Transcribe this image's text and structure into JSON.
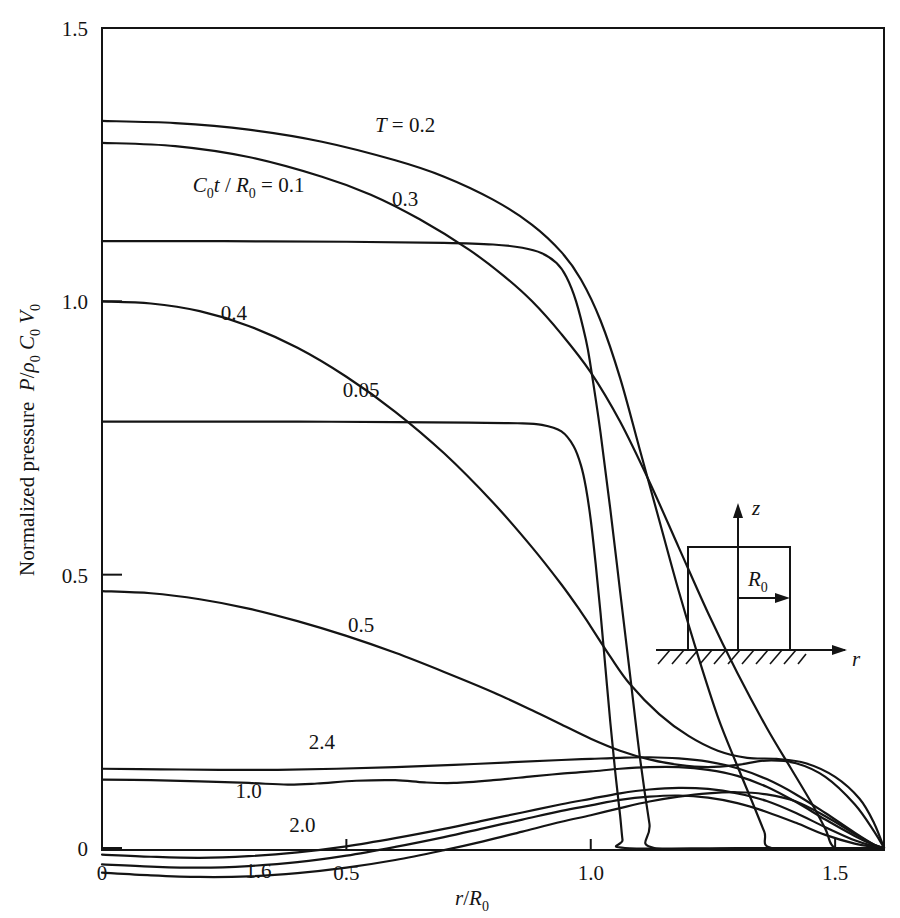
{
  "figure": {
    "kind": "line-plot",
    "background": "#ffffff",
    "ink_color": "#141414"
  },
  "chart_data": {
    "type": "line",
    "title": "",
    "subtitle": "",
    "xlabel": "r/R0",
    "xlabel_parts": {
      "var": "r",
      "slash": "/",
      "denom": "R",
      "denom_sub": "0"
    },
    "ylabel": "Normalized pressure P/ρ0 C0 V0",
    "ylabel_parts": {
      "text": "Normalized pressure",
      "p": "P",
      "slash": "/",
      "rho": "ρ",
      "rho_sub": "0",
      "c": "C",
      "c_sub": "0",
      "v": "V",
      "v_sub": "0"
    },
    "xlim": [
      0,
      1.6
    ],
    "ylim": [
      -0.09,
      1.5
    ],
    "grid": false,
    "legend_position": "inline-curve-labels",
    "xticks": [
      0,
      0.5,
      1.0,
      1.5
    ],
    "xtick_labels": [
      "0",
      "0.5",
      "1.0",
      "1.5"
    ],
    "yticks": [
      0,
      0.5,
      1.0,
      1.5
    ],
    "ytick_labels": [
      "0",
      "0.5",
      "1.0",
      "1.5"
    ],
    "parameter_name": "C0t/R0",
    "parameter_legend_text": "C0t / R0 = 0.1",
    "first_label_text": "T = 0.2",
    "series": [
      {
        "name": "0.05",
        "label": "0.05",
        "label_x": 0.53,
        "label_y": 0.825,
        "start_value": 0.78,
        "end_x": 1.07,
        "points": [
          [
            0.0,
            0.78
          ],
          [
            0.2,
            0.78
          ],
          [
            0.4,
            0.78
          ],
          [
            0.6,
            0.779
          ],
          [
            0.75,
            0.778
          ],
          [
            0.85,
            0.777
          ],
          [
            0.9,
            0.774
          ],
          [
            0.94,
            0.762
          ],
          [
            0.965,
            0.735
          ],
          [
            0.98,
            0.7
          ],
          [
            0.99,
            0.66
          ],
          [
            1.0,
            0.6
          ],
          [
            1.01,
            0.52
          ],
          [
            1.02,
            0.43
          ],
          [
            1.03,
            0.33
          ],
          [
            1.04,
            0.23
          ],
          [
            1.05,
            0.14
          ],
          [
            1.06,
            0.06
          ],
          [
            1.065,
            0.015
          ],
          [
            1.07,
            0.0
          ],
          [
            1.3,
            0.0
          ],
          [
            1.6,
            0.0
          ]
        ]
      },
      {
        "name": "0.1",
        "label": "C0t / R0 = 0.1",
        "label_x": 0.3,
        "label_y": 1.2,
        "start_value": 1.11,
        "end_x": 1.13,
        "points": [
          [
            0.0,
            1.11
          ],
          [
            0.25,
            1.11
          ],
          [
            0.5,
            1.109
          ],
          [
            0.7,
            1.107
          ],
          [
            0.8,
            1.104
          ],
          [
            0.86,
            1.098
          ],
          [
            0.9,
            1.088
          ],
          [
            0.93,
            1.07
          ],
          [
            0.95,
            1.045
          ],
          [
            0.97,
            1.0
          ],
          [
            0.99,
            0.93
          ],
          [
            1.0,
            0.88
          ],
          [
            1.02,
            0.76
          ],
          [
            1.04,
            0.62
          ],
          [
            1.06,
            0.47
          ],
          [
            1.08,
            0.32
          ],
          [
            1.1,
            0.17
          ],
          [
            1.12,
            0.045
          ],
          [
            1.13,
            0.0
          ],
          [
            1.35,
            0.0
          ],
          [
            1.6,
            0.0
          ]
        ]
      },
      {
        "name": "0.2",
        "label": "T = 0.2",
        "label_x": 0.62,
        "label_y": 1.31,
        "start_value": 1.33,
        "end_x": 1.37,
        "points": [
          [
            0.0,
            1.33
          ],
          [
            0.15,
            1.326
          ],
          [
            0.3,
            1.314
          ],
          [
            0.45,
            1.292
          ],
          [
            0.6,
            1.258
          ],
          [
            0.7,
            1.228
          ],
          [
            0.8,
            1.186
          ],
          [
            0.88,
            1.14
          ],
          [
            0.94,
            1.09
          ],
          [
            0.98,
            1.04
          ],
          [
            1.02,
            0.965
          ],
          [
            1.06,
            0.86
          ],
          [
            1.1,
            0.73
          ],
          [
            1.14,
            0.6
          ],
          [
            1.18,
            0.47
          ],
          [
            1.22,
            0.35
          ],
          [
            1.26,
            0.24
          ],
          [
            1.3,
            0.15
          ],
          [
            1.33,
            0.085
          ],
          [
            1.355,
            0.03
          ],
          [
            1.37,
            0.0
          ],
          [
            1.5,
            0.0
          ],
          [
            1.6,
            0.0
          ]
        ]
      },
      {
        "name": "0.3",
        "label": "0.3",
        "label_x": 0.62,
        "label_y": 1.175,
        "start_value": 1.29,
        "end_x": 1.5,
        "points": [
          [
            0.0,
            1.29
          ],
          [
            0.15,
            1.284
          ],
          [
            0.3,
            1.264
          ],
          [
            0.45,
            1.228
          ],
          [
            0.55,
            1.195
          ],
          [
            0.65,
            1.15
          ],
          [
            0.75,
            1.095
          ],
          [
            0.82,
            1.048
          ],
          [
            0.88,
            1.0
          ],
          [
            0.94,
            0.94
          ],
          [
            1.0,
            0.87
          ],
          [
            1.06,
            0.78
          ],
          [
            1.12,
            0.67
          ],
          [
            1.18,
            0.55
          ],
          [
            1.24,
            0.43
          ],
          [
            1.3,
            0.32
          ],
          [
            1.36,
            0.22
          ],
          [
            1.41,
            0.145
          ],
          [
            1.45,
            0.085
          ],
          [
            1.48,
            0.035
          ],
          [
            1.5,
            0.0
          ],
          [
            1.56,
            0.0
          ],
          [
            1.6,
            0.0
          ]
        ]
      },
      {
        "name": "0.4",
        "label": "0.4",
        "label_x": 0.27,
        "label_y": 0.965,
        "start_value": 1.0,
        "end_x": 1.6,
        "points": [
          [
            0.0,
            1.0
          ],
          [
            0.1,
            0.996
          ],
          [
            0.2,
            0.982
          ],
          [
            0.3,
            0.955
          ],
          [
            0.4,
            0.915
          ],
          [
            0.5,
            0.862
          ],
          [
            0.6,
            0.798
          ],
          [
            0.7,
            0.722
          ],
          [
            0.8,
            0.632
          ],
          [
            0.88,
            0.55
          ],
          [
            0.94,
            0.482
          ],
          [
            0.98,
            0.432
          ],
          [
            1.0,
            0.405
          ],
          [
            1.04,
            0.35
          ],
          [
            1.08,
            0.3
          ],
          [
            1.14,
            0.245
          ],
          [
            1.2,
            0.205
          ],
          [
            1.26,
            0.178
          ],
          [
            1.32,
            0.165
          ],
          [
            1.38,
            0.163
          ],
          [
            1.44,
            0.155
          ],
          [
            1.5,
            0.13
          ],
          [
            1.55,
            0.09
          ],
          [
            1.58,
            0.045
          ],
          [
            1.6,
            0.0
          ]
        ]
      },
      {
        "name": "0.5",
        "label": "0.5",
        "label_x": 0.53,
        "label_y": 0.395,
        "start_value": 0.47,
        "end_x": 1.6,
        "points": [
          [
            0.0,
            0.47
          ],
          [
            0.1,
            0.466
          ],
          [
            0.2,
            0.455
          ],
          [
            0.3,
            0.438
          ],
          [
            0.4,
            0.415
          ],
          [
            0.5,
            0.388
          ],
          [
            0.6,
            0.357
          ],
          [
            0.7,
            0.322
          ],
          [
            0.8,
            0.285
          ],
          [
            0.88,
            0.252
          ],
          [
            0.94,
            0.226
          ],
          [
            1.0,
            0.2
          ],
          [
            1.06,
            0.178
          ],
          [
            1.12,
            0.162
          ],
          [
            1.18,
            0.152
          ],
          [
            1.24,
            0.148
          ],
          [
            1.3,
            0.152
          ],
          [
            1.36,
            0.16
          ],
          [
            1.42,
            0.155
          ],
          [
            1.48,
            0.13
          ],
          [
            1.54,
            0.08
          ],
          [
            1.58,
            0.03
          ],
          [
            1.6,
            0.0
          ]
        ]
      },
      {
        "name": "1.0",
        "label": "1.0",
        "label_x": 0.3,
        "label_y": 0.092,
        "start_value": 0.125,
        "end_x": 1.6,
        "points": [
          [
            0.0,
            0.125
          ],
          [
            0.1,
            0.124
          ],
          [
            0.2,
            0.122
          ],
          [
            0.3,
            0.119
          ],
          [
            0.38,
            0.116
          ],
          [
            0.44,
            0.118
          ],
          [
            0.52,
            0.123
          ],
          [
            0.6,
            0.124
          ],
          [
            0.66,
            0.12
          ],
          [
            0.72,
            0.119
          ],
          [
            0.8,
            0.124
          ],
          [
            0.88,
            0.131
          ],
          [
            0.94,
            0.136
          ],
          [
            1.0,
            0.14
          ],
          [
            1.06,
            0.145
          ],
          [
            1.12,
            0.148
          ],
          [
            1.18,
            0.148
          ],
          [
            1.24,
            0.143
          ],
          [
            1.3,
            0.132
          ],
          [
            1.36,
            0.112
          ],
          [
            1.42,
            0.084
          ],
          [
            1.48,
            0.052
          ],
          [
            1.54,
            0.022
          ],
          [
            1.58,
            0.005
          ],
          [
            1.6,
            0.0
          ]
        ]
      },
      {
        "name": "1.6",
        "label": "1.6",
        "label_x": 0.32,
        "label_y": -0.055,
        "start_value": -0.045,
        "end_x": 1.6,
        "points": [
          [
            0.0,
            -0.045
          ],
          [
            0.1,
            -0.05
          ],
          [
            0.2,
            -0.053
          ],
          [
            0.3,
            -0.052
          ],
          [
            0.4,
            -0.046
          ],
          [
            0.5,
            -0.036
          ],
          [
            0.6,
            -0.022
          ],
          [
            0.7,
            -0.004
          ],
          [
            0.78,
            0.012
          ],
          [
            0.86,
            0.03
          ],
          [
            0.94,
            0.048
          ],
          [
            1.0,
            0.06
          ],
          [
            1.06,
            0.073
          ],
          [
            1.12,
            0.085
          ],
          [
            1.18,
            0.094
          ],
          [
            1.24,
            0.1
          ],
          [
            1.3,
            0.102
          ],
          [
            1.36,
            0.098
          ],
          [
            1.42,
            0.085
          ],
          [
            1.48,
            0.058
          ],
          [
            1.54,
            0.026
          ],
          [
            1.58,
            0.006
          ],
          [
            1.6,
            0.0
          ]
        ]
      },
      {
        "name": "2.0",
        "label": "2.0",
        "label_x": 0.41,
        "label_y": 0.03,
        "start_value": -0.012,
        "end_x": 1.6,
        "points": [
          [
            0.0,
            -0.012
          ],
          [
            0.1,
            -0.016
          ],
          [
            0.2,
            -0.018
          ],
          [
            0.3,
            -0.015
          ],
          [
            0.4,
            -0.008
          ],
          [
            0.5,
            0.003
          ],
          [
            0.6,
            0.018
          ],
          [
            0.7,
            0.035
          ],
          [
            0.78,
            0.05
          ],
          [
            0.86,
            0.065
          ],
          [
            0.94,
            0.08
          ],
          [
            1.0,
            0.09
          ],
          [
            1.06,
            0.1
          ],
          [
            1.12,
            0.107
          ],
          [
            1.18,
            0.11
          ],
          [
            1.24,
            0.108
          ],
          [
            1.3,
            0.1
          ],
          [
            1.36,
            0.086
          ],
          [
            1.42,
            0.064
          ],
          [
            1.48,
            0.038
          ],
          [
            1.54,
            0.014
          ],
          [
            1.58,
            0.003
          ],
          [
            1.6,
            0.0
          ]
        ]
      },
      {
        "name": "2.4",
        "label": "2.4",
        "label_x": 0.45,
        "label_y": 0.182,
        "start_value": 0.145,
        "end_x": 1.6,
        "points": [
          [
            0.0,
            0.145
          ],
          [
            0.12,
            0.144
          ],
          [
            0.24,
            0.143
          ],
          [
            0.36,
            0.143
          ],
          [
            0.48,
            0.145
          ],
          [
            0.6,
            0.148
          ],
          [
            0.72,
            0.152
          ],
          [
            0.84,
            0.157
          ],
          [
            0.94,
            0.161
          ],
          [
            1.0,
            0.163
          ],
          [
            1.06,
            0.165
          ],
          [
            1.12,
            0.166
          ],
          [
            1.18,
            0.164
          ],
          [
            1.24,
            0.158
          ],
          [
            1.3,
            0.146
          ],
          [
            1.36,
            0.126
          ],
          [
            1.42,
            0.098
          ],
          [
            1.48,
            0.064
          ],
          [
            1.54,
            0.028
          ],
          [
            1.58,
            0.006
          ],
          [
            1.6,
            0.0
          ]
        ]
      },
      {
        "name": "extra-negative",
        "label": "",
        "label_x": null,
        "label_y": null,
        "start_value": -0.03,
        "end_x": 1.6,
        "points": [
          [
            0.0,
            -0.03
          ],
          [
            0.1,
            -0.034
          ],
          [
            0.2,
            -0.036
          ],
          [
            0.3,
            -0.033
          ],
          [
            0.4,
            -0.026
          ],
          [
            0.5,
            -0.014
          ],
          [
            0.6,
            0.002
          ],
          [
            0.7,
            0.02
          ],
          [
            0.78,
            0.036
          ],
          [
            0.86,
            0.052
          ],
          [
            0.94,
            0.068
          ],
          [
            1.0,
            0.078
          ],
          [
            1.06,
            0.088
          ],
          [
            1.12,
            0.094
          ],
          [
            1.18,
            0.096
          ],
          [
            1.24,
            0.092
          ],
          [
            1.3,
            0.082
          ],
          [
            1.36,
            0.066
          ],
          [
            1.42,
            0.046
          ],
          [
            1.48,
            0.024
          ],
          [
            1.54,
            0.008
          ],
          [
            1.58,
            0.002
          ],
          [
            1.6,
            0.0
          ]
        ]
      }
    ]
  },
  "inset": {
    "name": "geometry-sketch",
    "z_label": "z",
    "r_label": "r",
    "radius_label": "R",
    "radius_sub": "0",
    "description": "cylindrical charge on rigid ground"
  }
}
